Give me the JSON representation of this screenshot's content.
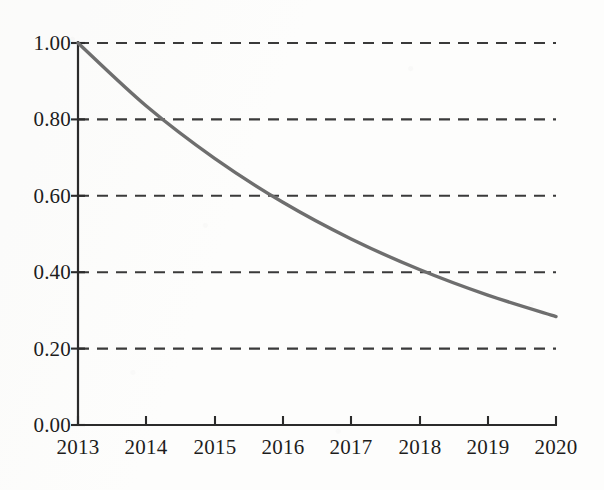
{
  "chart_data": {
    "type": "line",
    "title": "",
    "subtitle": "",
    "xlabel": "",
    "ylabel": "",
    "x": [
      2013,
      2014,
      2015,
      2016,
      2017,
      2018,
      2019,
      2020
    ],
    "categories": [
      "2013",
      "2014",
      "2015",
      "2016",
      "2017",
      "2018",
      "2019",
      "2020"
    ],
    "series": [
      {
        "name": "decay",
        "values": [
          1.0,
          0.835,
          0.698,
          0.583,
          0.487,
          0.407,
          0.34,
          0.284
        ],
        "color": "#6e6e6e"
      }
    ],
    "xlim": [
      2013,
      2020
    ],
    "ylim": [
      0.0,
      1.0
    ],
    "grid": true,
    "grid_axis": "y",
    "grid_style": "dashed",
    "legend": "none",
    "annotations": [],
    "xtick_labels": [
      "2013",
      "2014",
      "2015",
      "2016",
      "2017",
      "2018",
      "2019",
      "2020"
    ],
    "ytick_labels": [
      "0.00",
      "0.20",
      "0.40",
      "0.60",
      "0.80",
      "1.00"
    ],
    "ytick_values": [
      0.0,
      0.2,
      0.4,
      0.6,
      0.8,
      1.0
    ],
    "gridline_values": [
      0.2,
      0.4,
      0.6,
      0.8,
      1.0
    ],
    "notable_crossings": [
      {
        "y": 0.8,
        "x": 2014.25
      },
      {
        "y": 0.6,
        "x": 2015.75
      },
      {
        "y": 0.4,
        "x": 2017.9
      }
    ]
  },
  "style": {
    "axis_color": "#2b2b2b",
    "grid_color": "#3a3a3a",
    "curve_color": "#6e6e6e",
    "label_color": "#1d1d1d",
    "background": "#fdfdfc"
  }
}
